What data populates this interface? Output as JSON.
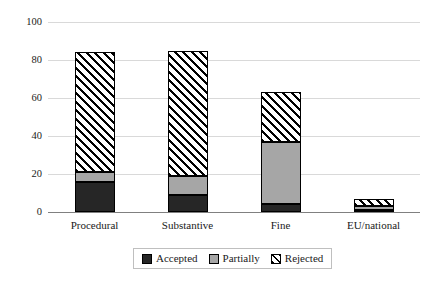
{
  "chart_data": {
    "type": "bar",
    "title": "",
    "subtitle": "",
    "xlabel": "",
    "ylabel": "",
    "stacked": true,
    "grid": true,
    "legend_position": "bottom",
    "ylim": [
      0,
      100
    ],
    "yticks": [
      0,
      20,
      40,
      60,
      80,
      100
    ],
    "ytick_labels": [
      "0",
      "20",
      "40",
      "60",
      "80",
      "100"
    ],
    "categories": [
      "Procedural",
      "Substantive",
      "Fine",
      "EU/national"
    ],
    "series": [
      {
        "name": "Accepted",
        "color": "#262626",
        "pattern": "solid",
        "values": [
          16,
          9,
          4,
          1
        ]
      },
      {
        "name": "Partially",
        "color": "#a6a6a6",
        "pattern": "solid",
        "values": [
          5,
          10,
          33,
          2
        ]
      },
      {
        "name": "Rejected",
        "color": "#ffffff",
        "pattern": "diagonal-hatch",
        "values": [
          63,
          66,
          26,
          4
        ]
      }
    ],
    "totals": [
      84,
      85,
      63,
      7
    ]
  },
  "legend": {
    "items": [
      {
        "label": "Accepted"
      },
      {
        "label": "Partially"
      },
      {
        "label": "Rejected"
      }
    ]
  },
  "colors": {
    "accepted": "#262626",
    "partially": "#a6a6a6",
    "rejected_fill": "#ffffff",
    "rejected_stroke": "#000000",
    "gridline": "#d9d9d9",
    "axis": "#808080",
    "background": "#ffffff",
    "text": "#1a1a1a"
  }
}
